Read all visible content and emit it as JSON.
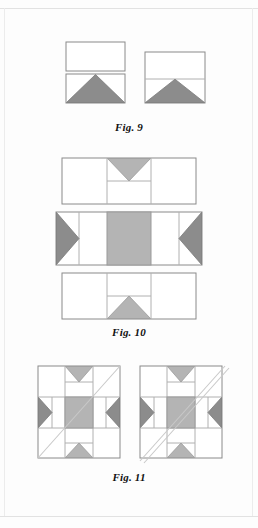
{
  "page": {
    "background_color": "#fdfdfd",
    "border_color": "#e2e2e2",
    "width": 258,
    "height": 528
  },
  "palette": {
    "white_patch": "#ffffff",
    "light_gray_patch": "#b4b4b4",
    "medium_gray_patch": "#9a9a9a",
    "dark_gray_patch": "#8c8c8c",
    "outline": "#8a8a8a",
    "thin_outline": "#b0b0b0",
    "diagonal_line": "#c9c9c9",
    "caption_color": "#111111"
  },
  "figures": [
    {
      "id": "fig9",
      "caption": "Fig. 9",
      "description": "Two flying-geese style units: a plain rectangle stacked above a rectangle containing a gray triangle, and a square split into a top rectangle and a lower band with a gray triangle.",
      "units": [
        {
          "name": "left-unit",
          "parts": [
            "plain-white-rectangle",
            "white-rectangle-with-gray-triangle"
          ]
        },
        {
          "name": "right-unit",
          "parts": [
            "white-upper-rectangle",
            "white-lower-rectangle-with-gray-triangle"
          ]
        }
      ]
    },
    {
      "id": "fig10",
      "caption": "Fig. 10",
      "description": "Three horizontal pieced rows forming the sashing strips of a block: a top row with a downward gray triangle, a middle row with dark gray side triangles and a large light gray center square, and a bottom row with an upward gray triangle.",
      "rows": [
        {
          "name": "top-row",
          "parts": [
            "white-left-rectangle",
            "downward-gray-triangle-unit",
            "white-lower-rectangle",
            "white-right-rectangle"
          ]
        },
        {
          "name": "middle-row",
          "parts": [
            "dark-gray-left-triangle",
            "white-rectangle",
            "light-gray-center-square",
            "white-rectangle",
            "dark-gray-right-triangle"
          ]
        },
        {
          "name": "bottom-row",
          "parts": [
            "white-left-rectangle",
            "white-upper-rectangle",
            "upward-gray-triangle-unit",
            "white-right-rectangle"
          ]
        }
      ]
    },
    {
      "id": "fig11",
      "caption": "Fig. 11",
      "description": "Two assembled blocks drawn as three-by-three grids. The left block carries a single thin diagonal line from the lower-left to the upper-right corner; the right block carries a pair of parallel diagonal lines forming a narrow band across the same corners.",
      "blocks": [
        {
          "name": "left-block",
          "diagonal": "single-line",
          "diagonal_direction": "bottom-left-to-top-right"
        },
        {
          "name": "right-block",
          "diagonal": "double-line-band",
          "diagonal_direction": "bottom-left-to-top-right"
        }
      ]
    }
  ]
}
